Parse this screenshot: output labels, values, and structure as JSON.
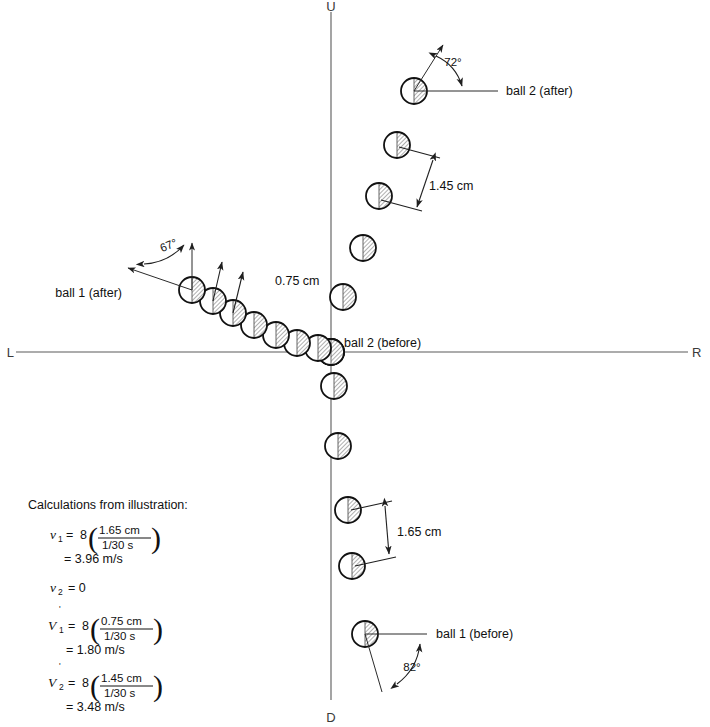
{
  "figure": {
    "type": "physics-collision-strobe-diagram",
    "axes": {
      "up_label": "U",
      "down_label": "D",
      "left_label": "L",
      "right_label": "R",
      "origin_x": 331,
      "origin_y": 352
    },
    "labels": {
      "ball2_after": "ball 2 (after)",
      "ball2_before": "ball 2 (before)",
      "ball1_after": "ball 1 (after)",
      "ball1_before": "ball 1 (before)"
    },
    "angles": {
      "ball2_after_deg": "72°",
      "ball1_after_deg": "67°",
      "ball1_before_deg": "82°"
    },
    "distances": {
      "ball2_after_spacing": "1.45 cm",
      "ball1_after_spacing": "0.75 cm",
      "ball1_before_spacing": "1.65 cm"
    },
    "colors": {
      "ball_outline": "#111111",
      "ball_light": "#ffffff",
      "ball_shade": "#a8a8a8",
      "axis": "#5a5a5a",
      "ink": "#111111"
    },
    "ball_tracks": {
      "ball1_before": [
        {
          "x": 331,
          "y": 352
        },
        {
          "x": 334,
          "y": 386
        },
        {
          "x": 338,
          "y": 446
        },
        {
          "x": 348,
          "y": 510
        },
        {
          "x": 352,
          "y": 566
        },
        {
          "x": 365,
          "y": 634
        }
      ],
      "ball2_after": [
        {
          "x": 331,
          "y": 352
        },
        {
          "x": 343,
          "y": 297
        },
        {
          "x": 363,
          "y": 248
        },
        {
          "x": 379,
          "y": 196
        },
        {
          "x": 397,
          "y": 145
        },
        {
          "x": 414,
          "y": 91
        }
      ],
      "ball1_after": [
        {
          "x": 331,
          "y": 352
        },
        {
          "x": 318,
          "y": 348
        },
        {
          "x": 297,
          "y": 343
        },
        {
          "x": 276,
          "y": 335
        },
        {
          "x": 254,
          "y": 325
        },
        {
          "x": 233,
          "y": 313
        },
        {
          "x": 213,
          "y": 301
        },
        {
          "x": 192,
          "y": 290
        }
      ]
    }
  },
  "calculations": {
    "heading": "Calculations from illustration:",
    "rows": [
      {
        "var": "v",
        "sub": "1",
        "prime": "",
        "coef": "8",
        "numerator": "1.65 cm",
        "denominator": "1/30 s",
        "result": "= 3.96 m/s"
      },
      {
        "var": "v",
        "sub": "2",
        "prime": "",
        "coef": "",
        "numerator": "",
        "denominator": "",
        "result": "= 0",
        "inline_zero": true
      },
      {
        "var": "V",
        "sub": "1",
        "prime": "'",
        "coef": "8",
        "numerator": "0.75 cm",
        "denominator": "1/30 s",
        "result": "= 1.80 m/s"
      },
      {
        "var": "V",
        "sub": "2",
        "prime": "'",
        "coef": "8",
        "numerator": "1.45 cm",
        "denominator": "1/30 s",
        "result": "= 3.48 m/s"
      }
    ]
  }
}
